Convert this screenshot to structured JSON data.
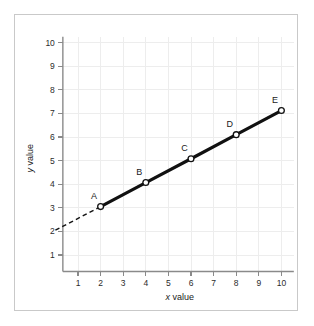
{
  "chart_data": {
    "type": "line",
    "title": "",
    "xlabel": "x value",
    "ylabel": "y value",
    "xlim": [
      0,
      10.6
    ],
    "ylim": [
      0,
      10.4
    ],
    "grid": true,
    "legend": null,
    "x_ticks": [
      "1",
      "2",
      "3",
      "4",
      "5",
      "6",
      "7",
      "8",
      "9",
      "10"
    ],
    "x_tick_values": [
      1,
      2,
      3,
      4,
      5,
      6,
      7,
      8,
      9,
      10
    ],
    "y_ticks": [
      "1",
      "2",
      "3",
      "4",
      "5",
      "6",
      "7",
      "8",
      "9",
      "10"
    ],
    "y_tick_values": [
      1,
      2,
      3,
      4,
      5,
      6,
      7,
      8,
      9,
      10
    ],
    "series": [
      {
        "name": "measured points",
        "style": "solid-line-with-open-circle-markers",
        "color": "#111111",
        "points": [
          {
            "label": "A",
            "x": 2,
            "y": 3.05
          },
          {
            "label": "B",
            "x": 4,
            "y": 4.07
          },
          {
            "label": "C",
            "x": 6,
            "y": 5.08
          },
          {
            "label": "D",
            "x": 8,
            "y": 6.1
          },
          {
            "label": "E",
            "x": 10,
            "y": 7.12
          }
        ]
      },
      {
        "name": "extrapolation to y-intercept",
        "style": "dashed",
        "color": "#111111",
        "points": [
          {
            "label": "",
            "x": 0,
            "y": 2.05
          },
          {
            "label": "",
            "x": 2,
            "y": 3.05
          }
        ]
      }
    ],
    "annotations": [
      {
        "text": "A",
        "x": 2,
        "y": 3.05,
        "position": "above-left"
      },
      {
        "text": "B",
        "x": 4,
        "y": 4.07,
        "position": "above-left"
      },
      {
        "text": "C",
        "x": 6,
        "y": 5.08,
        "position": "above-left"
      },
      {
        "text": "D",
        "x": 8,
        "y": 6.1,
        "position": "above-left"
      },
      {
        "text": "E",
        "x": 10,
        "y": 7.12,
        "position": "above-left"
      }
    ],
    "colors": {
      "background": "#ffffff",
      "frame": "#c9c9c9",
      "grid": "#ededed",
      "axis": "#8a8a8a",
      "data": "#111111",
      "marker_fill": "#ffffff",
      "text": "#1a1a1a"
    }
  },
  "axis_titles": {
    "x_variable": "x",
    "x_word": " value",
    "y_variable": "y",
    "y_word": " value"
  }
}
